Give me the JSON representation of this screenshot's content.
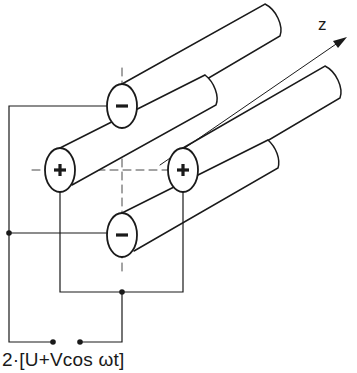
{
  "diagram": {
    "axis_label": "z",
    "formula": "2·[U+Vcos ωt]",
    "rods": [
      {
        "position": "top",
        "polarity": "−"
      },
      {
        "position": "left",
        "polarity": "+"
      },
      {
        "position": "right",
        "polarity": "+"
      },
      {
        "position": "bottom",
        "polarity": "−"
      }
    ],
    "colors": {
      "line": "#1a1a1a",
      "background": "#ffffff"
    }
  }
}
